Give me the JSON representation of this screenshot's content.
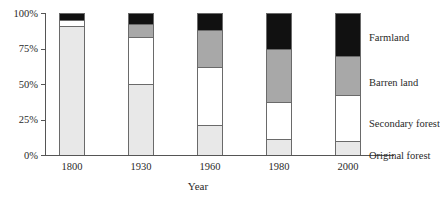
{
  "chart_data": {
    "type": "bar",
    "subtype": "stacked-100-percent",
    "title": "",
    "xlabel": "Year",
    "ylabel": "",
    "categories": [
      "1800",
      "1930",
      "1960",
      "1980",
      "2000"
    ],
    "ylim": [
      0,
      100
    ],
    "ytick_labels": [
      "0%",
      "25%",
      "50%",
      "75%",
      "100%"
    ],
    "ytick_values": [
      0,
      25,
      50,
      75,
      100
    ],
    "grid": false,
    "legend_position": "right",
    "series": [
      {
        "name": "Original forest",
        "color": "#e8e8e8",
        "values": [
          91,
          50,
          21,
          11,
          10
        ]
      },
      {
        "name": "Secondary forest",
        "color": "#ffffff",
        "values": [
          4,
          33,
          41,
          26,
          32
        ]
      },
      {
        "name": "Barren land",
        "color": "#a8a8a8",
        "values": [
          0,
          9,
          26,
          38,
          28
        ]
      },
      {
        "name": "Farmland",
        "color": "#111111",
        "values": [
          5,
          8,
          12,
          25,
          30
        ]
      }
    ]
  },
  "axes": {
    "y_ticks": [
      {
        "label": "100%",
        "value": 100
      },
      {
        "label": "75%",
        "value": 75
      },
      {
        "label": "50%",
        "value": 50
      },
      {
        "label": "25%",
        "value": 25
      },
      {
        "label": "0%",
        "value": 0
      }
    ],
    "x_ticks": [
      {
        "label": "1800"
      },
      {
        "label": "1930"
      },
      {
        "label": "1960"
      },
      {
        "label": "1980"
      },
      {
        "label": "2000"
      }
    ],
    "x_title": "Year"
  },
  "legend": {
    "items": [
      {
        "label": "Farmland",
        "color": "#111111"
      },
      {
        "label": "Barren land",
        "color": "#a8a8a8"
      },
      {
        "label": "Secondary forest",
        "color": "#ffffff"
      },
      {
        "label": "Original forest",
        "color": "#e8e8e8"
      }
    ]
  },
  "colors": {
    "axis": "#555555",
    "outline": "#6a6a6a",
    "text": "#2a2a2a",
    "background": "#ffffff"
  }
}
